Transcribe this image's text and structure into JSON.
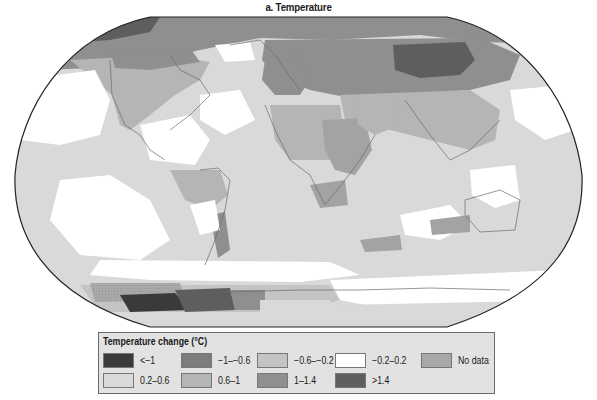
{
  "title": "a. Temperature",
  "legend": {
    "title": "Temperature change (°C)",
    "items": [
      {
        "label": "<−1",
        "color": "#3a3a3a",
        "row": 0,
        "col": 0
      },
      {
        "label": "−1–−0.6",
        "color": "#7c7c7c",
        "row": 0,
        "col": 1
      },
      {
        "label": "−0.6–−0.2",
        "color": "#c4c4c4",
        "row": 0,
        "col": 2
      },
      {
        "label": "−0.2–0.2",
        "color": "#ffffff",
        "row": 0,
        "col": 3
      },
      {
        "label": "No data",
        "color": "#a8a8a8",
        "row": 0,
        "col": 4
      },
      {
        "label": "0.2–0.6",
        "color": "#d9d9d9",
        "row": 1,
        "col": 0
      },
      {
        "label": "0.6–1",
        "color": "#b5b5b5",
        "row": 1,
        "col": 1
      },
      {
        "label": "1–1.4",
        "color": "#8f8f8f",
        "row": 1,
        "col": 2
      },
      {
        "label": ">1.4",
        "color": "#5e5e5e",
        "row": 1,
        "col": 3
      }
    ]
  },
  "map": {
    "projection": "Robinson-like world map",
    "ocean_base_color": "#d9d9d9",
    "regions": [
      {
        "name": "Arctic North America / Greenland",
        "category": "1–1.4"
      },
      {
        "name": "Western North America",
        "category": "0.6–1"
      },
      {
        "name": "Northern Eurasia / Siberia",
        "category": "1–1.4"
      },
      {
        "name": "Central Siberia / Mongolia",
        "category": ">1.4"
      },
      {
        "name": "North Africa / Sahara",
        "category": "0.6–1"
      },
      {
        "name": "Middle East / Arabia",
        "category": "0.6–1"
      },
      {
        "name": "Central South America",
        "category": "0.6–1"
      },
      {
        "name": "Tropical oceans",
        "category": "0.2–0.6"
      },
      {
        "name": "North Pacific / North Atlantic patches",
        "category": "−0.2–0.2"
      },
      {
        "name": "Southern Ocean",
        "category": "−0.2–0.2"
      },
      {
        "name": "Antarctic Peninsula / West Antarctica",
        "category": ">1.4"
      },
      {
        "name": "Weddell Sea sector",
        "category": "<−1"
      }
    ]
  }
}
